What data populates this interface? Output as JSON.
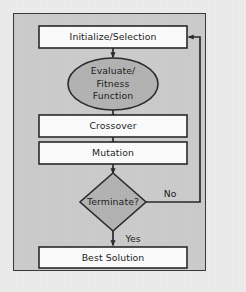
{
  "figure": {
    "background_color": "#ededed",
    "panel_color": "#cdcdcd",
    "border_color": "#3a3a3a",
    "box_fill": "#fdfdfd",
    "shape_fill": "#b4b4b4",
    "line_color": "#2b2b2b"
  },
  "nodes": [
    {
      "id": "initialize-selection",
      "shape": "rectangle",
      "label": "Initialize/Selection",
      "lines": [
        "Initialize/Selection"
      ],
      "fill": "#fdfdfd"
    },
    {
      "id": "evaluate-fitness-function",
      "shape": "ellipse",
      "label": "Evaluate/ Fitness Function",
      "lines": [
        "Evaluate/",
        "Fitness",
        "Function"
      ],
      "fill": "#b4b4b4"
    },
    {
      "id": "crossover",
      "shape": "rectangle",
      "label": "Crossover",
      "lines": [
        "Crossover"
      ],
      "fill": "#fdfdfd"
    },
    {
      "id": "mutation",
      "shape": "rectangle",
      "label": "Mutation",
      "lines": [
        "Mutation"
      ],
      "fill": "#fdfdfd"
    },
    {
      "id": "terminate-decision",
      "shape": "diamond",
      "label": "Terminate?",
      "lines": [
        "Terminate?"
      ],
      "fill": "#b4b4b4"
    },
    {
      "id": "best-solution",
      "shape": "rectangle",
      "label": "Best Solution",
      "lines": [
        "Best Solution"
      ],
      "fill": "#fdfdfd"
    }
  ],
  "edges": [
    {
      "id": "e1",
      "from": "initialize-selection",
      "to": "evaluate-fitness-function",
      "label": ""
    },
    {
      "id": "e2",
      "from": "evaluate-fitness-function",
      "to": "crossover",
      "label": ""
    },
    {
      "id": "e3",
      "from": "crossover",
      "to": "mutation",
      "label": ""
    },
    {
      "id": "e4",
      "from": "mutation",
      "to": "terminate-decision",
      "label": ""
    },
    {
      "id": "e5",
      "from": "terminate-decision",
      "to": "best-solution",
      "label": "Yes"
    },
    {
      "id": "e6",
      "from": "terminate-decision",
      "to": "initialize-selection",
      "label": "No"
    }
  ],
  "edge_labels": {
    "no": "No",
    "yes": "Yes"
  }
}
